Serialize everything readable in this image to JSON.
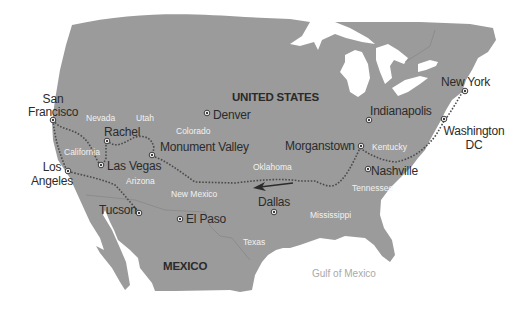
{
  "map": {
    "title": "Road trip route across the United States",
    "colors": {
      "land": "#9b9b9b",
      "water": "#ffffff",
      "route": "#4a4a4a",
      "city_label": "#2b2b2b",
      "state_label": "#f2f2f2",
      "water_label": "#a9a9a9"
    },
    "countries": [
      {
        "name": "UNITED STATES"
      },
      {
        "name": "MEXICO"
      }
    ],
    "water_bodies": [
      {
        "name": "Gulf of Mexico"
      }
    ],
    "states": [
      {
        "name": "Nevada"
      },
      {
        "name": "Utah"
      },
      {
        "name": "Colorado"
      },
      {
        "name": "California"
      },
      {
        "name": "Arizona"
      },
      {
        "name": "New Mexico"
      },
      {
        "name": "Oklahoma"
      },
      {
        "name": "Texas"
      },
      {
        "name": "Kentucky"
      },
      {
        "name": "Tennessee"
      },
      {
        "name": "Mississippi"
      }
    ],
    "cities": [
      {
        "name_line1": "San",
        "name_line2": "Francisco",
        "on_route": true
      },
      {
        "name_line1": "Los",
        "name_line2": "Angeles",
        "on_route": true
      },
      {
        "name": "Rachel",
        "on_route": true
      },
      {
        "name": "Las Vegas",
        "on_route": true
      },
      {
        "name": "Monument Valley",
        "on_route": true
      },
      {
        "name": "Tucson",
        "on_route": true
      },
      {
        "name": "El Paso",
        "on_route": false
      },
      {
        "name": "Denver",
        "on_route": false
      },
      {
        "name": "Dallas",
        "on_route": false
      },
      {
        "name": "Morganstown",
        "on_route": true
      },
      {
        "name": "Nashville",
        "on_route": false
      },
      {
        "name": "Indianapolis",
        "on_route": false
      },
      {
        "name": "New York",
        "on_route": true
      },
      {
        "name_line1": "Washington",
        "name_line2": "DC",
        "on_route": true
      }
    ],
    "route": {
      "style": "dotted",
      "direction": "east-to-west",
      "direction_arrow": "left-arrow"
    }
  }
}
